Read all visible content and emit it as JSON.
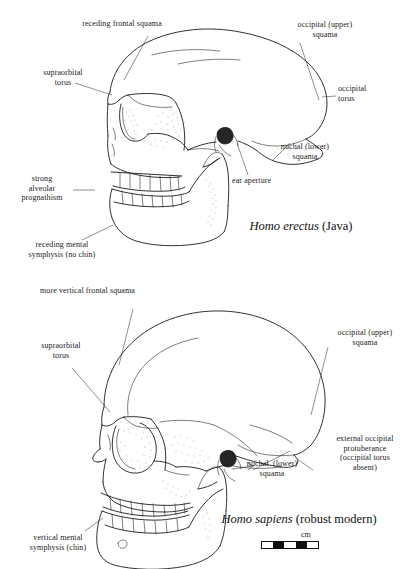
{
  "figure": {
    "scale": {
      "unit_label": "cm",
      "segments": [
        "light",
        "dark",
        "light",
        "dark",
        "light"
      ]
    }
  },
  "panels": [
    {
      "id": "homo-erectus",
      "caption_species": "Homo erectus",
      "caption_common": " (Java)",
      "labels": [
        {
          "key": "receding-frontal-squama",
          "text": "receding frontal squama"
        },
        {
          "key": "supraorbital-torus",
          "text": "supraorbital\ntorus"
        },
        {
          "key": "occipital-upper-squama",
          "text": "occipital (upper)\nsquama"
        },
        {
          "key": "occipital-torus",
          "text": "occipital\ntorus"
        },
        {
          "key": "nuchal-lower-squama",
          "text": "nuchal (lower)\nsquama"
        },
        {
          "key": "ear-aperture",
          "text": "ear aperture"
        },
        {
          "key": "strong-alveolar-prognathism",
          "text": "strong\nalveolar\nprognathism"
        },
        {
          "key": "receding-mental-symphysis",
          "text": "receding mental\nsymphysis (no chin)"
        }
      ]
    },
    {
      "id": "homo-sapiens",
      "caption_species": "Homo sapiens",
      "caption_common": " (robust modern)",
      "labels": [
        {
          "key": "more-vertical-frontal-squama",
          "text": "more vertical frontal squama"
        },
        {
          "key": "supraorbital-torus",
          "text": "supraorbital\ntorus"
        },
        {
          "key": "occipital-upper-squama",
          "text": "occipital (upper)\nsquama"
        },
        {
          "key": "external-occipital-protuberance",
          "text": "external occipital\nprotuberance\n(occipital torus\nabsent)"
        },
        {
          "key": "nuchal-lower-squama",
          "text": "nuchal  (lower)\nsquama"
        },
        {
          "key": "vertical-mental-symphysis",
          "text": "vertical mental\nsymphysis (chin)"
        }
      ]
    }
  ],
  "colors": {
    "ink": "#1b1b1b",
    "leader": "#333333",
    "paper": "#ffffff"
  }
}
